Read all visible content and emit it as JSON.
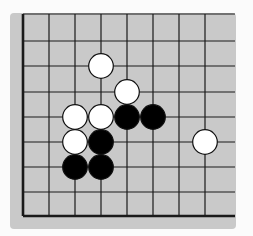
{
  "board": {
    "description": "Go board fragment (lower-left corner region)",
    "columns": 8,
    "rows": 9,
    "left_edge_is_board_edge": true,
    "bottom_edge_is_board_edge": true,
    "colors": {
      "board": "#c9c9c9",
      "line": "#1a1a1a",
      "black_stone": "#000000",
      "white_stone": "#ffffff"
    },
    "stones": [
      {
        "color": "white",
        "col": 3,
        "row": 2
      },
      {
        "color": "white",
        "col": 4,
        "row": 3
      },
      {
        "color": "white",
        "col": 2,
        "row": 4
      },
      {
        "color": "white",
        "col": 3,
        "row": 4
      },
      {
        "color": "black",
        "col": 4,
        "row": 4
      },
      {
        "color": "black",
        "col": 5,
        "row": 4
      },
      {
        "color": "white",
        "col": 2,
        "row": 5
      },
      {
        "color": "black",
        "col": 3,
        "row": 5
      },
      {
        "color": "white",
        "col": 7,
        "row": 5
      },
      {
        "color": "black",
        "col": 2,
        "row": 6
      },
      {
        "color": "black",
        "col": 3,
        "row": 6
      }
    ]
  }
}
